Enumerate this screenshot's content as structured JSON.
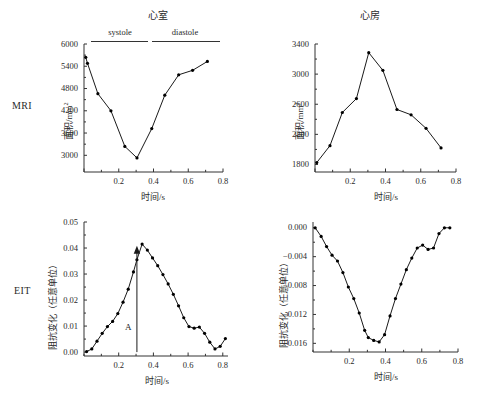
{
  "figure": {
    "row_labels": [
      {
        "id": "mri",
        "text": "MRI"
      },
      {
        "id": "eit",
        "text": "EIT"
      }
    ],
    "column_titles": [
      {
        "id": "ventricle",
        "text": "心室"
      },
      {
        "id": "atrium",
        "text": "心房"
      }
    ],
    "phase_labels": [
      {
        "id": "systole",
        "text": "systole"
      },
      {
        "id": "diastole",
        "text": "diastole"
      }
    ],
    "annotation_a": "A",
    "axis_color": "#333333",
    "line_color": "#1a1a1a",
    "marker_color": "#000000"
  },
  "chart_data": [
    {
      "id": "mri-ventricle",
      "type": "line",
      "title": "心室",
      "row": "MRI",
      "xlabel": "时间/s",
      "ylabel": "面积/mm²",
      "ylabel_base": "面积/mm",
      "ylabel_sup": "2",
      "xlim": [
        0.0,
        0.8
      ],
      "ylim": [
        2550,
        6000
      ],
      "xticks": [
        0.0,
        0.2,
        0.4,
        0.6,
        0.8
      ],
      "xticklabels": [
        "",
        "0.2",
        "0.4",
        "0.6",
        "0.8"
      ],
      "xminorticks": [
        0.1,
        0.3,
        0.5,
        0.7
      ],
      "yticks": [
        3000,
        3600,
        4200,
        4800,
        5400,
        6000
      ],
      "yticklabels": [
        "3000",
        "3600",
        "4200",
        "4800",
        "5400",
        "6000"
      ],
      "grid": false,
      "legend": "none",
      "phase_split_x": 0.305,
      "x": [
        0.01,
        0.02,
        0.08,
        0.155,
        0.235,
        0.305,
        0.39,
        0.465,
        0.545,
        0.625,
        0.71
      ],
      "y": [
        5640,
        5480,
        4660,
        4200,
        3240,
        2930,
        3720,
        4620,
        5170,
        5290,
        5530
      ]
    },
    {
      "id": "mri-atrium",
      "type": "line",
      "title": "心房",
      "row": "MRI",
      "xlabel": "时间/s",
      "ylabel": "面积/mm²",
      "ylabel_base": "面积/mm",
      "ylabel_sup": "2",
      "xlim": [
        0.0,
        0.8
      ],
      "ylim": [
        1700,
        3400
      ],
      "xticks": [
        0.0,
        0.2,
        0.4,
        0.6,
        0.8
      ],
      "xticklabels": [
        "",
        "0.2",
        "0.4",
        "0.6",
        "0.8"
      ],
      "xminorticks": [
        0.1,
        0.3,
        0.5,
        0.7
      ],
      "yticks": [
        1800,
        2200,
        2600,
        3000,
        3400
      ],
      "yticklabels": [
        "1800",
        "2200",
        "2600",
        "3000",
        "3400"
      ],
      "grid": false,
      "legend": "none",
      "x": [
        0.01,
        0.085,
        0.155,
        0.235,
        0.305,
        0.385,
        0.465,
        0.545,
        0.63,
        0.715
      ],
      "y": [
        1825,
        2050,
        2490,
        2675,
        3285,
        3050,
        2530,
        2460,
        2280,
        2020
      ]
    },
    {
      "id": "eit-ventricle",
      "type": "line",
      "title": "",
      "row": "EIT",
      "xlabel": "时间/s",
      "ylabel": "阻抗变化（任意单位）",
      "xlim": [
        0.0,
        0.83
      ],
      "ylim": [
        -0.0015,
        0.05
      ],
      "xticks": [
        0.2,
        0.4,
        0.6,
        0.8
      ],
      "xticklabels": [
        "0.2",
        "0.4",
        "0.6",
        "0.8"
      ],
      "yticks": [
        0.0,
        0.01,
        0.02,
        0.03,
        0.04,
        0.05
      ],
      "yticklabels": [
        "0.00",
        "0.01",
        "0.02",
        "0.03",
        "0.04",
        "0.05"
      ],
      "grid": false,
      "legend": "none",
      "annotation": {
        "label": "A",
        "x": 0.305,
        "y_from": 0.0,
        "y_to": 0.0405
      },
      "x": [
        0.015,
        0.045,
        0.075,
        0.105,
        0.135,
        0.165,
        0.195,
        0.225,
        0.255,
        0.285,
        0.305,
        0.335,
        0.365,
        0.395,
        0.425,
        0.455,
        0.485,
        0.515,
        0.545,
        0.575,
        0.605,
        0.635,
        0.665,
        0.695,
        0.725,
        0.755,
        0.785,
        0.815
      ],
      "y": [
        0.0002,
        0.0012,
        0.0042,
        0.0072,
        0.0098,
        0.0118,
        0.0148,
        0.0192,
        0.0242,
        0.0308,
        0.0355,
        0.0415,
        0.0392,
        0.0362,
        0.0332,
        0.0298,
        0.0262,
        0.0222,
        0.0178,
        0.0132,
        0.0098,
        0.0092,
        0.0096,
        0.0072,
        0.0038,
        0.0012,
        0.0022,
        0.0052
      ]
    },
    {
      "id": "eit-atrium",
      "type": "line",
      "title": "",
      "row": "EIT",
      "xlabel": "时间/s",
      "ylabel": "阻抗变化（任意单位）",
      "xlim": [
        0.0,
        0.8
      ],
      "ylim": [
        -0.0172,
        0.0008
      ],
      "xticks": [
        0.2,
        0.4,
        0.6,
        0.8
      ],
      "xticklabels": [
        "0.2",
        "0.4",
        "0.6",
        "0.8"
      ],
      "yticks": [
        0.0,
        -0.004,
        -0.008,
        -0.012,
        -0.016
      ],
      "yticklabels": [
        "0.000",
        "−0.004",
        "−0.008",
        "−0.012",
        "−0.016"
      ],
      "grid": false,
      "legend": "none",
      "x": [
        0.012,
        0.045,
        0.075,
        0.105,
        0.135,
        0.165,
        0.195,
        0.225,
        0.255,
        0.285,
        0.305,
        0.335,
        0.365,
        0.395,
        0.425,
        0.455,
        0.485,
        0.515,
        0.545,
        0.575,
        0.605,
        0.635,
        0.665,
        0.695,
        0.725,
        0.755
      ],
      "y": [
        0.0,
        -0.0012,
        -0.0026,
        -0.0038,
        -0.0046,
        -0.0062,
        -0.0082,
        -0.0098,
        -0.0118,
        -0.0142,
        -0.0152,
        -0.0156,
        -0.0158,
        -0.0148,
        -0.0122,
        -0.0098,
        -0.0078,
        -0.0058,
        -0.0042,
        -0.0028,
        -0.0024,
        -0.003,
        -0.0028,
        -0.0008,
        0.0,
        0.0
      ]
    }
  ]
}
